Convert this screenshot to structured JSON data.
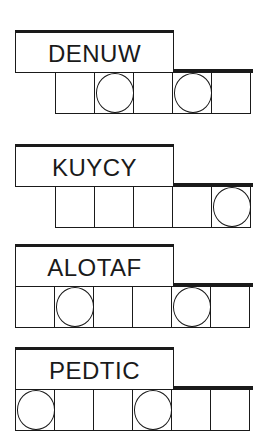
{
  "puzzles": [
    {
      "scrambled_word": "DENUW",
      "num_cells": 5,
      "circled_cells": [
        2,
        4
      ]
    },
    {
      "scrambled_word": "KUYCY",
      "num_cells": 5,
      "circled_cells": [
        5
      ]
    },
    {
      "scrambled_word": "ALOTAF",
      "num_cells": 6,
      "circled_cells": [
        2,
        5
      ]
    },
    {
      "scrambled_word": "PEDTIC",
      "num_cells": 6,
      "circled_cells": [
        1,
        4
      ]
    }
  ],
  "colors": {
    "ink": "#1a1a1a",
    "background": "#ffffff"
  }
}
